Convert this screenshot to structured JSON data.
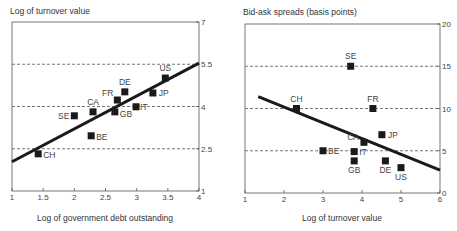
{
  "chart_data": [
    {
      "type": "scatter",
      "title": "Log of turnover value",
      "xlabel": "Log of government debt outstanding",
      "ylabel": "Log of turnover value",
      "xlim": [
        1,
        4
      ],
      "ylim": [
        1,
        7
      ],
      "x_ticks": [
        "1",
        "1.5",
        "2",
        "2.5",
        "3",
        "3.5",
        "4"
      ],
      "y_ticks": [
        "1",
        "2.5",
        "4",
        "5.5",
        "7"
      ],
      "y_axis_side": "right",
      "dashed_gridlines_y": [
        2.5,
        4,
        5.5
      ],
      "points": [
        {
          "label": "US",
          "x": 3.46,
          "y": 5.01
        },
        {
          "label": "JP",
          "x": 3.26,
          "y": 4.48
        },
        {
          "label": "DE",
          "x": 2.81,
          "y": 4.52
        },
        {
          "label": "FR",
          "x": 2.69,
          "y": 4.23
        },
        {
          "label": "IT",
          "x": 2.99,
          "y": 3.99
        },
        {
          "label": "CA",
          "x": 2.3,
          "y": 3.81
        },
        {
          "label": "GB",
          "x": 2.65,
          "y": 3.81
        },
        {
          "label": "SE",
          "x": 2.0,
          "y": 3.67
        },
        {
          "label": "BE",
          "x": 2.27,
          "y": 2.96
        },
        {
          "label": "CH",
          "x": 1.42,
          "y": 2.32
        }
      ],
      "regression_line": {
        "x": [
          1,
          4
        ],
        "y": [
          2.04,
          5.54
        ]
      }
    },
    {
      "type": "scatter",
      "title": "Bid-ask spreads (basis points)",
      "xlabel": "Log of turnover value",
      "ylabel": "Bid-ask spreads (basis points)",
      "xlim": [
        1,
        6
      ],
      "ylim": [
        0,
        20
      ],
      "x_ticks": [
        "1",
        "2",
        "3",
        "4",
        "5",
        "6"
      ],
      "y_ticks": [
        "0",
        "5",
        "10",
        "15",
        "20"
      ],
      "y_axis_side": "right",
      "dashed_gridlines_y": [
        5,
        10,
        15
      ],
      "points": [
        {
          "label": "SE",
          "x": 3.71,
          "y": 15.0
        },
        {
          "label": "CH",
          "x": 2.32,
          "y": 10.0
        },
        {
          "label": "FR",
          "x": 4.28,
          "y": 10.0
        },
        {
          "label": "JP",
          "x": 4.51,
          "y": 6.9
        },
        {
          "label": "CA",
          "x": 4.05,
          "y": 6.0
        },
        {
          "label": "BE",
          "x": 3.0,
          "y": 5.0
        },
        {
          "label": "IT",
          "x": 3.8,
          "y": 4.9
        },
        {
          "label": "GB",
          "x": 3.8,
          "y": 3.8
        },
        {
          "label": "DE",
          "x": 4.6,
          "y": 3.8
        },
        {
          "label": "US",
          "x": 5.0,
          "y": 3.0
        }
      ],
      "regression_line": {
        "x": [
          1.34,
          6
        ],
        "y": [
          11.4,
          2.7
        ]
      }
    }
  ],
  "left": {
    "title": "Log of turnover value",
    "xlabel": "Log of government debt outstanding"
  },
  "right": {
    "title": "Bid-ask spreads (basis points)",
    "xlabel": "Log of turnover value"
  }
}
